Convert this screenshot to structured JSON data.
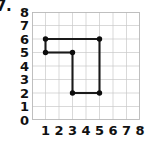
{
  "problem": {
    "number": "7."
  },
  "chart_data": {
    "type": "scatter",
    "title": "",
    "xlabel": "",
    "ylabel": "",
    "xlim": [
      0,
      8
    ],
    "ylim": [
      0,
      8
    ],
    "grid": true,
    "legend": false,
    "x_ticks": [
      "1",
      "2",
      "3",
      "4",
      "5",
      "6",
      "7",
      "8"
    ],
    "y_ticks": [
      "8",
      "7",
      "6",
      "5",
      "4",
      "3",
      "2",
      "1",
      "0"
    ],
    "x_tick_values": [
      1,
      2,
      3,
      4,
      5,
      6,
      7,
      8
    ],
    "y_tick_values": [
      8,
      7,
      6,
      5,
      4,
      3,
      2,
      1,
      0
    ],
    "points": [
      {
        "label": "A",
        "x": 1,
        "y": 6
      },
      {
        "label": "B",
        "x": 5,
        "y": 6
      },
      {
        "label": "C",
        "x": 5,
        "y": 2
      },
      {
        "label": "D",
        "x": 3,
        "y": 2
      },
      {
        "label": "E",
        "x": 3,
        "y": 5
      },
      {
        "label": "F",
        "x": 1,
        "y": 5
      }
    ],
    "segments": [
      {
        "from": [
          1,
          6
        ],
        "to": [
          5,
          6
        ]
      },
      {
        "from": [
          5,
          6
        ],
        "to": [
          5,
          2
        ]
      },
      {
        "from": [
          5,
          2
        ],
        "to": [
          3,
          2
        ]
      },
      {
        "from": [
          3,
          2
        ],
        "to": [
          3,
          5
        ]
      },
      {
        "from": [
          3,
          5
        ],
        "to": [
          1,
          5
        ]
      },
      {
        "from": [
          1,
          5
        ],
        "to": [
          1,
          6
        ]
      }
    ],
    "colors": {
      "data": "#1a1a1a",
      "grid": "#c9c9c9",
      "border": "#b8b8b8",
      "text": "#111111",
      "background": "#ffffff"
    }
  }
}
